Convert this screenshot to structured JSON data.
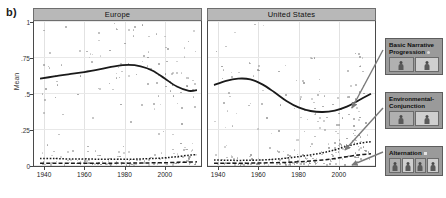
{
  "figure": {
    "panel_label": "b)",
    "y_axis_title": "Mean",
    "y_ticks": [
      "1",
      ".75",
      ".5",
      ".25",
      "0"
    ],
    "y_tick_values": [
      1,
      0.75,
      0.5,
      0.25,
      0
    ],
    "x_ticks": [
      "1940",
      "1960",
      "1980",
      "2000"
    ],
    "x_tick_values": [
      1940,
      1960,
      1980,
      2000
    ],
    "facets": [
      {
        "title": "Europe"
      },
      {
        "title": "United States"
      }
    ]
  },
  "legend": {
    "items": [
      {
        "label_line1": "Basic Narrative",
        "label_line2": "Progression",
        "marker": "circle",
        "thumb_count": 2
      },
      {
        "label_line1": "Environmental-",
        "label_line2": "Conjunction",
        "marker": "circle-small",
        "thumb_count": 2
      },
      {
        "label_line1": "Alternation",
        "label_line2": "",
        "marker": "square",
        "thumb_count": 4
      }
    ]
  },
  "colors": {
    "facet_header": "#b8b8b8",
    "legend_background": "#9a9a9a",
    "point": "#8d8d8d",
    "line": "#1a1a1a",
    "grid": "#e2e2e2",
    "axis": "#4a4a4a"
  },
  "chart_data": {
    "type": "line",
    "title": "",
    "xlabel": "",
    "ylabel": "Mean",
    "xlim": [
      1935,
      2018
    ],
    "ylim": [
      0,
      1
    ],
    "grid": true,
    "legend_position": "right",
    "facets": [
      {
        "name": "Europe",
        "series": [
          {
            "name": "Basic Narrative Progression",
            "style": "solid",
            "x": [
              1938,
              1945,
              1952,
              1960,
              1968,
              1975,
              1982,
              1988,
              1994,
              2000,
              2006,
              2012,
              2016
            ],
            "y": [
              0.6,
              0.615,
              0.63,
              0.645,
              0.665,
              0.685,
              0.695,
              0.685,
              0.655,
              0.6,
              0.545,
              0.515,
              0.52
            ]
          },
          {
            "name": "Environmental-Conjunction",
            "style": "dotted",
            "x": [
              1938,
              1945,
              1952,
              1960,
              1968,
              1975,
              1982,
              1988,
              1994,
              2000,
              2006,
              2012,
              2016
            ],
            "y": [
              0.045,
              0.045,
              0.042,
              0.042,
              0.04,
              0.04,
              0.04,
              0.042,
              0.045,
              0.05,
              0.058,
              0.068,
              0.072
            ]
          },
          {
            "name": "Alternation",
            "style": "dashed",
            "x": [
              1938,
              1945,
              1952,
              1960,
              1968,
              1975,
              1982,
              1988,
              1994,
              2000,
              2006,
              2012,
              2016
            ],
            "y": [
              0.012,
              0.012,
              0.012,
              0.012,
              0.012,
              0.013,
              0.013,
              0.014,
              0.015,
              0.016,
              0.018,
              0.02,
              0.022
            ]
          }
        ],
        "scatter_seed": 11
      },
      {
        "name": "United States",
        "series": [
          {
            "name": "Basic Narrative Progression",
            "style": "solid",
            "x": [
              1938,
              1944,
              1950,
              1956,
              1962,
              1968,
              1974,
              1980,
              1986,
              1992,
              1998,
              2004,
              2010,
              2016
            ],
            "y": [
              0.555,
              0.585,
              0.6,
              0.595,
              0.56,
              0.505,
              0.445,
              0.4,
              0.375,
              0.368,
              0.378,
              0.405,
              0.45,
              0.495
            ]
          },
          {
            "name": "Environmental-Conjunction",
            "style": "dotted",
            "x": [
              1938,
              1944,
              1950,
              1956,
              1962,
              1968,
              1974,
              1980,
              1986,
              1992,
              1998,
              2004,
              2010,
              2016
            ],
            "y": [
              0.035,
              0.033,
              0.032,
              0.033,
              0.035,
              0.04,
              0.048,
              0.058,
              0.07,
              0.085,
              0.105,
              0.13,
              0.15,
              0.162
            ]
          },
          {
            "name": "Alternation",
            "style": "dashed",
            "x": [
              1938,
              1944,
              1950,
              1956,
              1962,
              1968,
              1974,
              1980,
              1986,
              1992,
              1998,
              2004,
              2010,
              2016
            ],
            "y": [
              0.012,
              0.012,
              0.012,
              0.013,
              0.014,
              0.016,
              0.018,
              0.022,
              0.028,
              0.035,
              0.045,
              0.058,
              0.07,
              0.078
            ]
          }
        ],
        "scatter_seed": 29
      }
    ]
  }
}
